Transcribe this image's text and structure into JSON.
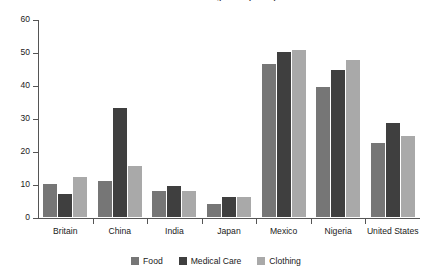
{
  "chart_data": {
    "type": "bar",
    "title": "did not have enough money to buy:",
    "xlabel": "",
    "ylabel": "",
    "ylim": [
      0,
      60
    ],
    "yticks": [
      0,
      10,
      20,
      30,
      40,
      50,
      60
    ],
    "ytick_labels": [
      "0",
      "10",
      "20",
      "30",
      "40",
      "50",
      "60"
    ],
    "grid": false,
    "legend_position": "bottom-center",
    "categories": [
      "Britain",
      "China",
      "India",
      "Japan",
      "Mexico",
      "Nigeria",
      "United States"
    ],
    "series": [
      {
        "name": "Food",
        "color": "#767676",
        "values": [
          10,
          11,
          8,
          4,
          46.5,
          39.5,
          22.5
        ]
      },
      {
        "name": "Medical Care",
        "color": "#3f3f3f",
        "values": [
          7,
          33,
          9.5,
          6,
          50,
          44.5,
          28.5
        ]
      },
      {
        "name": "Clothing",
        "color": "#a9a9a9",
        "values": [
          12,
          15.5,
          8,
          6,
          50.5,
          47.5,
          24.5
        ]
      }
    ]
  },
  "axis": {
    "tick_color": "#555555"
  }
}
